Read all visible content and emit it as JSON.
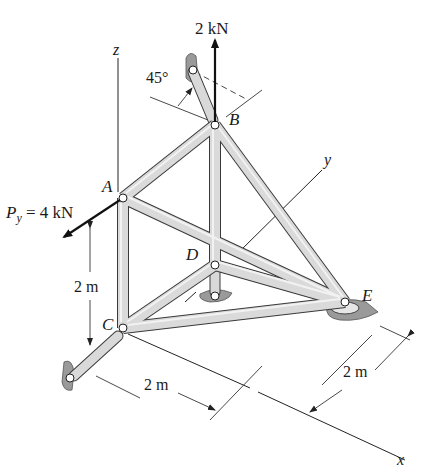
{
  "figure": {
    "type": "space truss diagram",
    "colors": {
      "member_fill": "#d9d9d9",
      "member_stroke": "#3a3a3a",
      "support_fill": "#9a9a9a",
      "line": "#222222"
    }
  },
  "axes": {
    "x": "x",
    "y": "y",
    "z": "z"
  },
  "joints": {
    "A": "A",
    "B": "B",
    "C": "C",
    "D": "D",
    "E": "E"
  },
  "loads": {
    "vertical_at_B": "2 kN",
    "py_label": "P",
    "py_subscript": "y",
    "py_value": " = 4 kN"
  },
  "angles": {
    "support_B": "45°"
  },
  "dimensions": {
    "height_AC": "2 m",
    "length_C_x": "2 m",
    "width_E": "2 m"
  },
  "members": [
    "AB",
    "AC",
    "AE",
    "BD",
    "BE",
    "CD",
    "CE",
    "DE"
  ]
}
